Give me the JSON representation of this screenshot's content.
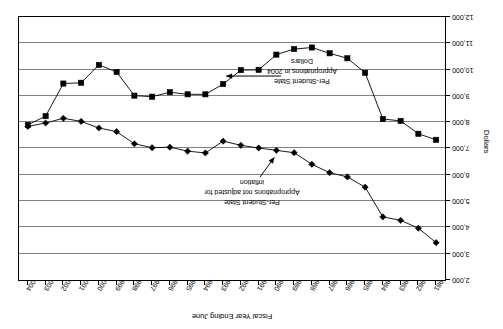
{
  "chart_data": {
    "type": "line",
    "title": "",
    "xlabel": "Fiscal Year Ending June",
    "ylabel": "Dollars",
    "ylim": [
      2000,
      12000
    ],
    "y_ticks": [
      "2,000",
      "3,000",
      "4,000",
      "5,000",
      "6,000",
      "7,000",
      "8,000",
      "9,000",
      "10,000",
      "11,000",
      "12,000"
    ],
    "y_tick_values": [
      2000,
      3000,
      4000,
      5000,
      6000,
      7000,
      8000,
      9000,
      10000,
      11000,
      12000
    ],
    "grid": true,
    "legend_position": "none",
    "orientation_note": "image rendered rotated 180 degrees",
    "categories": [
      "1981",
      "1982",
      "1983",
      "1984",
      "1985",
      "1986",
      "1987",
      "1988",
      "1989",
      "1990",
      "1991",
      "1992",
      "1993",
      "1994",
      "1995",
      "1996",
      "1997",
      "1998",
      "1999",
      "2000",
      "2001",
      "2002",
      "2003",
      "2004"
    ],
    "series": [
      {
        "name": "Per-Student State Appropriations not adjusted for inflation",
        "marker": "diamond",
        "values": [
          3420,
          3970,
          4270,
          4400,
          5530,
          5920,
          6080,
          6400,
          6840,
          6930,
          7020,
          7120,
          7280,
          6830,
          6900,
          7050,
          7030,
          7180,
          7640,
          7780,
          8030,
          8150,
          7970,
          7840
        ]
      },
      {
        "name": "Per-Student State Appropriations in 2004 Dollars",
        "marker": "square",
        "values": [
          7330,
          7560,
          8050,
          8120,
          9880,
          10430,
          10620,
          10840,
          10780,
          10570,
          9990,
          9980,
          9450,
          9060,
          9060,
          9140,
          8970,
          9010,
          9910,
          10180,
          9500,
          9470,
          8230,
          7900
        ]
      }
    ],
    "annotations": [
      {
        "name": "nominal-annotation",
        "lines": [
          "Per-Student State",
          "Appropriations not adjusted for",
          "inflation"
        ],
        "points_to_year": 1990
      },
      {
        "name": "real-annotation",
        "lines": [
          "Per-Student State",
          "Appropriations in 2004",
          "Dollars"
        ],
        "points_to_year": 1993
      }
    ],
    "colors": {
      "series_line": "#000000",
      "marker_fill": "#000000",
      "gridline": "#808080",
      "frame": "#000000",
      "background": "#ffffff"
    }
  }
}
